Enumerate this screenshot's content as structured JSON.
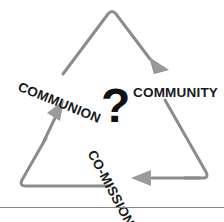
{
  "diagram": {
    "type": "cycle-triangle",
    "title": "",
    "center_symbol": "?",
    "stroke_color": "#8c8c8c",
    "label_color": "#1a1a1a",
    "center_symbol_color": "#111111",
    "background_color": "#ffffff",
    "flow_direction": "clockwise",
    "nodes": [
      {
        "id": "communion",
        "label": "COMMUNION",
        "rotation_deg": 22,
        "position": "left"
      },
      {
        "id": "community",
        "label": "COMMUNITY",
        "rotation_deg": 0,
        "position": "right"
      },
      {
        "id": "comission",
        "label": "CO-MISSION",
        "rotation_deg": 62,
        "position": "bottom"
      }
    ],
    "arrows": [
      {
        "id": "arrow-to-community",
        "from": "apex",
        "to": "community",
        "direction": "down-right"
      },
      {
        "id": "arrow-to-comission",
        "from": "community",
        "to": "comission",
        "direction": "left"
      },
      {
        "id": "arrow-to-communion",
        "from": "comission",
        "to": "communion",
        "direction": "up-right"
      }
    ]
  },
  "footer": {
    "rule_color": "#8a8a8a",
    "caption": ""
  }
}
